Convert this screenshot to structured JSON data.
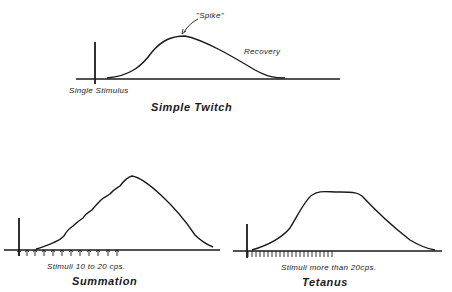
{
  "panels": {
    "simple_twitch": {
      "title": "Simple Twitch",
      "stimulus_label": "Single Stimulus",
      "peak_label": "\"Spike\"",
      "recovery_label": "Recovery",
      "stimulus_count": 1
    },
    "summation": {
      "title": "Summation",
      "stimulus_label": "Stimuli  10 to 20 cps.",
      "stimulus_count": 12
    },
    "tetanus": {
      "title": "Tetanus",
      "stimulus_label": "Stimuli  more than 20cps.",
      "stimulus_count": 24
    }
  },
  "colors": {
    "line": "#1a1a1a",
    "background": "#ffffff"
  }
}
